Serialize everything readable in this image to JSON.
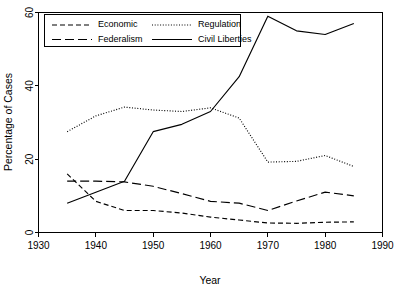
{
  "chart_data": {
    "type": "line",
    "title": "",
    "xlabel": "Year",
    "ylabel": "Percentage of Cases",
    "xlim": [
      1930,
      1990
    ],
    "ylim": [
      0,
      60
    ],
    "xticks": [
      1930,
      1940,
      1950,
      1960,
      1970,
      1980,
      1990
    ],
    "yticks": [
      0,
      20,
      40,
      60
    ],
    "xtick_labels": [
      "1930",
      "1940",
      "1950",
      "1960",
      "1970",
      "1980",
      "1985",
      "1990"
    ],
    "ytick_labels": [
      "0",
      "20",
      "40",
      "60"
    ],
    "grid": false,
    "legend_position": "top-left",
    "x": [
      1935,
      1940,
      1945,
      1950,
      1955,
      1960,
      1965,
      1970,
      1975,
      1980,
      1985
    ],
    "series": [
      {
        "name": "Economic",
        "linestyle": "dashed-short",
        "color": "#000000",
        "values": [
          16.0,
          8.5,
          6.0,
          6.0,
          5.3,
          4.2,
          3.4,
          2.6,
          2.5,
          2.8,
          2.9
        ]
      },
      {
        "name": "Federalism",
        "linestyle": "dashed-long",
        "color": "#000000",
        "values": [
          14.0,
          14.0,
          13.8,
          12.6,
          10.6,
          8.5,
          8.0,
          6.0,
          8.6,
          11.0,
          10.0
        ]
      },
      {
        "name": "Regulation",
        "linestyle": "dotted",
        "color": "#000000",
        "values": [
          27.5,
          31.8,
          34.2,
          33.4,
          33.0,
          34.0,
          31.2,
          19.2,
          19.4,
          21.0,
          18.0
        ]
      },
      {
        "name": "Civil Liberties",
        "linestyle": "solid",
        "color": "#000000",
        "values": [
          8.0,
          11.0,
          14.0,
          27.5,
          29.5,
          33.0,
          42.5,
          59.0,
          55.0,
          54.0,
          57.0
        ]
      }
    ]
  },
  "legend": {
    "entries": [
      {
        "label": "Economic",
        "style": "dashed-short"
      },
      {
        "label": "Regulation",
        "style": "dotted"
      },
      {
        "label": "Federalism",
        "style": "dashed-long"
      },
      {
        "label": "Civil Liberties",
        "style": "solid"
      }
    ]
  },
  "axes": {
    "x_title": "Year",
    "y_title": "Percentage of Cases"
  }
}
